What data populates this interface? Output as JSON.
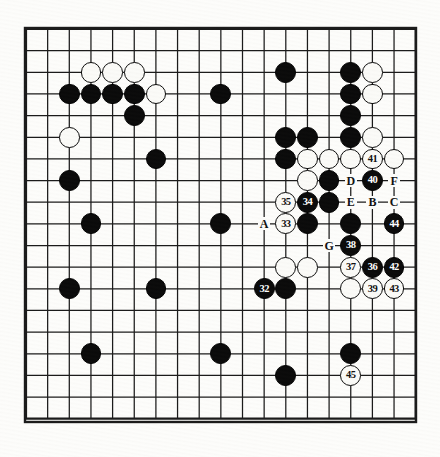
{
  "figure": {
    "type": "go-board-diagram",
    "title": "",
    "board_size": 19,
    "background_color": "#fdfdfb",
    "line_color": "#1a1a1a",
    "black_color": "#0a0a0a",
    "white_color": "#fbfbf8"
  },
  "geometry": {
    "origin_x": 26,
    "origin_y": 29,
    "spacing": 21.65,
    "stone_radius": 10.4,
    "border_width": 2.2,
    "outer_border_width": 1
  },
  "star_points": [
    [
      3,
      3
    ],
    [
      9,
      3
    ],
    [
      15,
      3
    ],
    [
      3,
      9
    ],
    [
      9,
      9
    ],
    [
      15,
      9
    ],
    [
      3,
      15
    ],
    [
      9,
      15
    ],
    [
      15,
      15
    ]
  ],
  "stones": [
    {
      "col": 3,
      "row": 2,
      "color": "white",
      "label": ""
    },
    {
      "col": 4,
      "row": 2,
      "color": "white",
      "label": ""
    },
    {
      "col": 5,
      "row": 2,
      "color": "white",
      "label": ""
    },
    {
      "col": 12,
      "row": 2,
      "color": "black",
      "label": ""
    },
    {
      "col": 15,
      "row": 2,
      "color": "black",
      "label": ""
    },
    {
      "col": 16,
      "row": 2,
      "color": "white",
      "label": ""
    },
    {
      "col": 2,
      "row": 3,
      "color": "black",
      "label": ""
    },
    {
      "col": 3,
      "row": 3,
      "color": "black",
      "label": ""
    },
    {
      "col": 4,
      "row": 3,
      "color": "black",
      "label": ""
    },
    {
      "col": 5,
      "row": 3,
      "color": "black",
      "label": ""
    },
    {
      "col": 6,
      "row": 3,
      "color": "white",
      "label": ""
    },
    {
      "col": 9,
      "row": 3,
      "color": "black",
      "label": ""
    },
    {
      "col": 15,
      "row": 3,
      "color": "black",
      "label": ""
    },
    {
      "col": 16,
      "row": 3,
      "color": "white",
      "label": ""
    },
    {
      "col": 5,
      "row": 4,
      "color": "black",
      "label": ""
    },
    {
      "col": 15,
      "row": 4,
      "color": "black",
      "label": ""
    },
    {
      "col": 2,
      "row": 5,
      "color": "white",
      "label": ""
    },
    {
      "col": 12,
      "row": 5,
      "color": "black",
      "label": ""
    },
    {
      "col": 13,
      "row": 5,
      "color": "black",
      "label": ""
    },
    {
      "col": 15,
      "row": 5,
      "color": "black",
      "label": ""
    },
    {
      "col": 16,
      "row": 5,
      "color": "white",
      "label": ""
    },
    {
      "col": 6,
      "row": 6,
      "color": "black",
      "label": ""
    },
    {
      "col": 12,
      "row": 6,
      "color": "black",
      "label": ""
    },
    {
      "col": 13,
      "row": 6,
      "color": "white",
      "label": ""
    },
    {
      "col": 14,
      "row": 6,
      "color": "white",
      "label": ""
    },
    {
      "col": 15,
      "row": 6,
      "color": "white",
      "label": ""
    },
    {
      "col": 16,
      "row": 6,
      "color": "white",
      "label": "41"
    },
    {
      "col": 17,
      "row": 6,
      "color": "white",
      "label": ""
    },
    {
      "col": 2,
      "row": 7,
      "color": "black",
      "label": ""
    },
    {
      "col": 13,
      "row": 7,
      "color": "white",
      "label": ""
    },
    {
      "col": 14,
      "row": 7,
      "color": "black",
      "label": ""
    },
    {
      "col": 16,
      "row": 7,
      "color": "black",
      "label": "40"
    },
    {
      "col": 12,
      "row": 8,
      "color": "white",
      "label": "35"
    },
    {
      "col": 13,
      "row": 8,
      "color": "black",
      "label": "34"
    },
    {
      "col": 14,
      "row": 8,
      "color": "black",
      "label": ""
    },
    {
      "col": 3,
      "row": 9,
      "color": "black",
      "label": ""
    },
    {
      "col": 9,
      "row": 9,
      "color": "black",
      "label": ""
    },
    {
      "col": 12,
      "row": 9,
      "color": "white",
      "label": "33"
    },
    {
      "col": 13,
      "row": 9,
      "color": "black",
      "label": ""
    },
    {
      "col": 15,
      "row": 9,
      "color": "black",
      "label": ""
    },
    {
      "col": 17,
      "row": 9,
      "color": "black",
      "label": "44"
    },
    {
      "col": 15,
      "row": 10,
      "color": "black",
      "label": "38"
    },
    {
      "col": 12,
      "row": 11,
      "color": "white",
      "label": ""
    },
    {
      "col": 13,
      "row": 11,
      "color": "white",
      "label": ""
    },
    {
      "col": 15,
      "row": 11,
      "color": "white",
      "label": "37"
    },
    {
      "col": 16,
      "row": 11,
      "color": "black",
      "label": "36"
    },
    {
      "col": 17,
      "row": 11,
      "color": "black",
      "label": "42"
    },
    {
      "col": 2,
      "row": 12,
      "color": "black",
      "label": ""
    },
    {
      "col": 6,
      "row": 12,
      "color": "black",
      "label": ""
    },
    {
      "col": 11,
      "row": 12,
      "color": "black",
      "label": "32"
    },
    {
      "col": 12,
      "row": 12,
      "color": "black",
      "label": ""
    },
    {
      "col": 15,
      "row": 12,
      "color": "white",
      "label": ""
    },
    {
      "col": 16,
      "row": 12,
      "color": "white",
      "label": "39"
    },
    {
      "col": 17,
      "row": 12,
      "color": "white",
      "label": "43"
    },
    {
      "col": 3,
      "row": 15,
      "color": "black",
      "label": ""
    },
    {
      "col": 9,
      "row": 15,
      "color": "black",
      "label": ""
    },
    {
      "col": 15,
      "row": 15,
      "color": "black",
      "label": ""
    },
    {
      "col": 12,
      "row": 16,
      "color": "black",
      "label": ""
    },
    {
      "col": 15,
      "row": 16,
      "color": "white",
      "label": "45"
    }
  ],
  "markers": [
    {
      "col": 15,
      "row": 7,
      "label": "D"
    },
    {
      "col": 17,
      "row": 7,
      "label": "F"
    },
    {
      "col": 15,
      "row": 8,
      "label": "E"
    },
    {
      "col": 16,
      "row": 8,
      "label": "B"
    },
    {
      "col": 17,
      "row": 8,
      "label": "C"
    },
    {
      "col": 11,
      "row": 9,
      "label": "A"
    },
    {
      "col": 14,
      "row": 10,
      "label": "G"
    }
  ],
  "legend": {
    "numbered_moves": [
      "32",
      "33",
      "34",
      "35",
      "36",
      "37",
      "38",
      "39",
      "40",
      "41",
      "42",
      "43",
      "44",
      "45"
    ],
    "letter_points": [
      "A",
      "B",
      "C",
      "D",
      "E",
      "F",
      "G"
    ]
  }
}
